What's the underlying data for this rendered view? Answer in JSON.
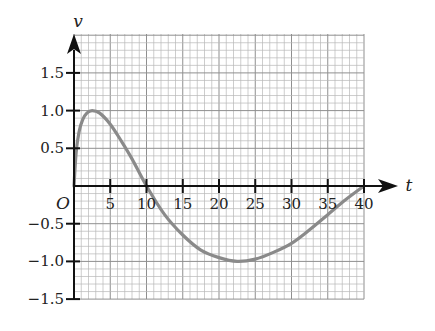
{
  "chart_data": {
    "type": "line",
    "title": "",
    "xlabel": "t",
    "ylabel": "v",
    "origin_label": "O",
    "xlim": [
      0,
      40
    ],
    "ylim": [
      -1.5,
      2.0
    ],
    "grid": true,
    "grid_minor_x_step": 1,
    "grid_minor_y_step": 0.1,
    "grid_major_x_step": 5,
    "grid_major_y_step": 0.5,
    "x_ticks": [
      5,
      10,
      15,
      20,
      25,
      30,
      35,
      40
    ],
    "x_tick_labels": [
      "5",
      "10",
      "15",
      "20",
      "25",
      "30",
      "35",
      "40"
    ],
    "y_ticks": [
      1.5,
      1.0,
      0.5,
      -0.5,
      -1.0,
      -1.5
    ],
    "y_tick_labels": [
      "1.5",
      "1.0",
      "0.5",
      "−0.5",
      "−1.0",
      "−1.5"
    ],
    "series": [
      {
        "name": "v(t)",
        "color": "#8a8a8a",
        "x": [
          0,
          0.3,
          0.7,
          1.2,
          1.8,
          2.5,
          3.5,
          5,
          6.5,
          8,
          10,
          12.5,
          15,
          17.5,
          20,
          22.5,
          25,
          27.5,
          30,
          32.5,
          35,
          37.5,
          40
        ],
        "y": [
          0,
          0.45,
          0.72,
          0.88,
          0.97,
          1.0,
          0.97,
          0.82,
          0.6,
          0.36,
          0.0,
          -0.38,
          -0.65,
          -0.85,
          -0.95,
          -1.0,
          -0.97,
          -0.88,
          -0.76,
          -0.58,
          -0.38,
          -0.18,
          0.0
        ]
      }
    ]
  },
  "colors": {
    "axis": "#111111",
    "grid_minor": "#b8b8b8",
    "grid_major": "#8f8f8f",
    "curve": "#8a8a8a"
  }
}
